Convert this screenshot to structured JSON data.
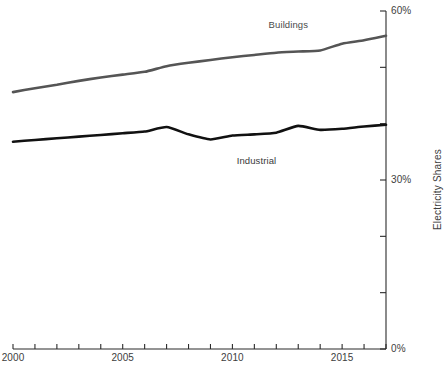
{
  "chart_data": {
    "type": "line",
    "title": "",
    "subtitle": "",
    "xlabel": "",
    "ylabel": "Electricity Shares",
    "xlim": [
      2000,
      2017
    ],
    "ylim": [
      0,
      60
    ],
    "grid": false,
    "legend_position": "inline-annotations",
    "y_unit": "%",
    "y_axis_side": "right",
    "x_ticks": [
      2000,
      2001,
      2002,
      2003,
      2004,
      2005,
      2006,
      2007,
      2008,
      2009,
      2010,
      2011,
      2012,
      2013,
      2014,
      2015,
      2016,
      2017
    ],
    "x_tick_labels": [
      "2000",
      "",
      "",
      "",
      "",
      "2005",
      "",
      "",
      "",
      "",
      "2010",
      "",
      "",
      "",
      "",
      "2015",
      "",
      ""
    ],
    "y_ticks": [
      0,
      10,
      20,
      30,
      40,
      50,
      60
    ],
    "y_tick_labels": [
      "0%",
      "",
      "",
      "30%",
      "",
      "",
      "60%"
    ],
    "x": [
      2000,
      2001,
      2002,
      2003,
      2004,
      2005,
      2006,
      2007,
      2008,
      2009,
      2010,
      2011,
      2012,
      2013,
      2014,
      2015,
      2016,
      2017
    ],
    "series": [
      {
        "name": "Buildings",
        "color": "#555555",
        "label_x": 2013.2,
        "label_y": 57.6,
        "values": [
          45.6,
          46.3,
          46.9,
          47.6,
          48.2,
          48.7,
          49.2,
          50.2,
          50.8,
          51.3,
          51.8,
          52.2,
          52.6,
          52.8,
          53.0,
          54.2,
          54.8,
          55.6
        ]
      },
      {
        "name": "Industrial",
        "color": "#111111",
        "label_x": 2011.2,
        "label_y": 33.4,
        "values": [
          36.8,
          37.1,
          37.4,
          37.7,
          38.0,
          38.3,
          38.6,
          39.4,
          38.1,
          37.2,
          37.9,
          38.1,
          38.4,
          39.6,
          38.9,
          39.1,
          39.5,
          39.8
        ]
      }
    ]
  },
  "axes": {
    "y_axis_title": "Electricity Shares"
  }
}
